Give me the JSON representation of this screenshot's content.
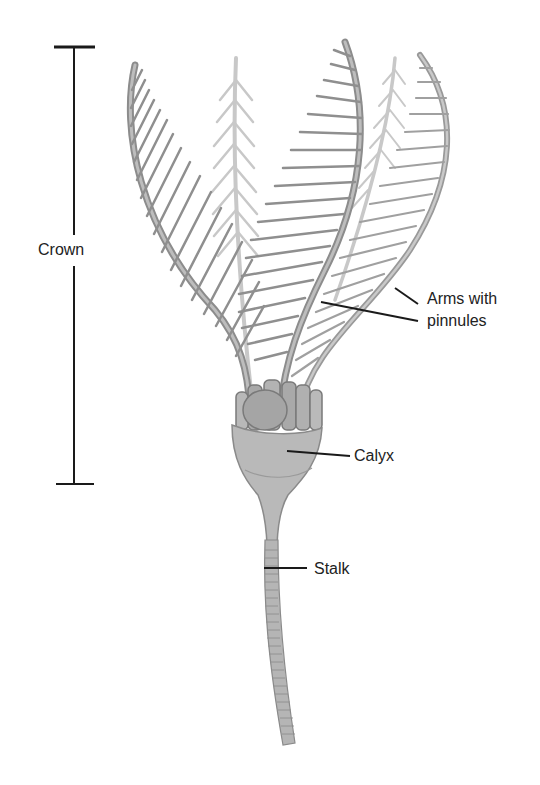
{
  "diagram": {
    "labels": {
      "crown": "Crown",
      "arms_line1": "Arms with",
      "arms_line2": "pinnules",
      "calyx": "Calyx",
      "stalk": "Stalk"
    },
    "colors": {
      "background": "#ffffff",
      "line": "#1a1a1a",
      "body_fill": "#b8b8b8",
      "body_stroke": "#8a8a8a",
      "arm_dark": "#8c8c8c",
      "arm_light": "#c4c4c4"
    }
  }
}
